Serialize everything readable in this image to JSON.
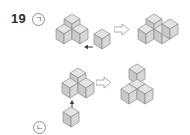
{
  "page": {
    "problem_number": "19",
    "background_color": "#ffffff"
  },
  "palette": {
    "cube_top": "#e4e4e4",
    "cube_left": "#c9c9c9",
    "cube_right": "#d8d8d8",
    "cube_stroke": "#8a8a8a",
    "arrow_fill": "#ffffff",
    "arrow_stroke": "#9a9a9a",
    "small_arrow": "#3a3a3a",
    "text": "#2b2b2b",
    "label_text": "#5f5f5f"
  },
  "rows": [
    {
      "id": "row-1",
      "label": "ㄱ",
      "label_name": "giyeok",
      "base_shape": {
        "name": "base-shape-a",
        "cube_count": 3,
        "description": "three cubes: one back, one front-left, one front-right"
      },
      "added_cube": {
        "name": "added-cube-a",
        "cube_count": 1,
        "direction": "left"
      },
      "transform_arrow": {
        "name": "transform-arrow-a",
        "direction": "right"
      },
      "result_shape": {
        "name": "result-shape-a",
        "cube_count": 4,
        "description": "four cubes: one back, one front-left, one front-right, one far-right"
      }
    },
    {
      "id": "row-2",
      "label": "ㄴ",
      "label_name": "nieun",
      "base_shape": {
        "name": "base-shape-b",
        "cube_count": 3,
        "description": "three cubes: one back, one front-left, one front-right"
      },
      "added_cube": {
        "name": "added-cube-b",
        "cube_count": 1,
        "direction": "up"
      },
      "transform_arrow": {
        "name": "transform-arrow-b",
        "direction": "right"
      },
      "result_shape": {
        "name": "result-shape-b",
        "cube_count": 4,
        "description": "four cubes: three-cube base with one cube stacked on top"
      }
    }
  ]
}
